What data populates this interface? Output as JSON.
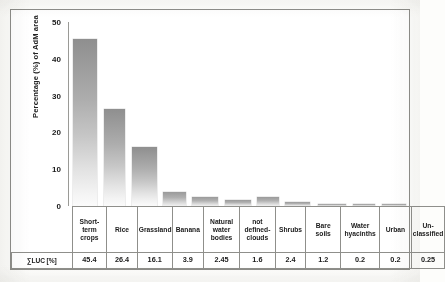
{
  "chart_data": {
    "type": "bar",
    "title": "",
    "subtitle": "",
    "xlabel": "",
    "ylabel": "Percentage (%) of AdM area",
    "ylim": [
      0,
      50
    ],
    "yticks": [
      "0",
      "10",
      "20",
      "30",
      "40",
      "50"
    ],
    "grid": false,
    "legend": "none",
    "categories": [
      "Short-term crops",
      "Rice",
      "Grassland",
      "Banana",
      "Natural water bodies",
      "not defined-clouds",
      "Shrubs",
      "Bare soils",
      "Water hyacinths",
      "Urban",
      "Un-classified"
    ],
    "category_lines": [
      [
        "Short-",
        "term",
        "crops"
      ],
      [
        "Rice"
      ],
      [
        "Grassland"
      ],
      [
        "Banana"
      ],
      [
        "Natural",
        "water",
        "bodies"
      ],
      [
        "not",
        "defined-",
        "clouds"
      ],
      [
        "Shrubs"
      ],
      [
        "Bare soils"
      ],
      [
        "Water",
        "hyacinths"
      ],
      [
        "Urban"
      ],
      [
        "Un-",
        "classified"
      ]
    ],
    "values": [
      45.4,
      26.4,
      16.1,
      3.9,
      2.45,
      1.6,
      2.4,
      1.2,
      0.2,
      0.2,
      0.25
    ],
    "value_labels": [
      "45.4",
      "26.4",
      "16.1",
      "3.9",
      "2.45",
      "1.6",
      "2.4",
      "1.2",
      "0.2",
      "0.2",
      "0.25"
    ],
    "series_row_label": "∑LUC [%]",
    "bar_color_top": "#8f8f8f",
    "bar_color_bottom": "#fbfbfb",
    "axis_color": "#9a9a96",
    "frame_color": "#8d8d89"
  }
}
